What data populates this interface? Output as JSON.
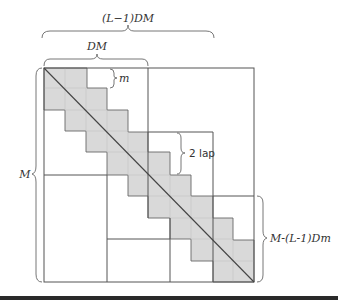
{
  "diagram": {
    "labels": {
      "top_span": "(L−1)DM",
      "dm_span": "DM",
      "m_span": "m",
      "overlap": "2 lap",
      "left_span": "M",
      "right_span": "M-(L-1)Dm"
    },
    "colors": {
      "band_fill": "#d9d9d9",
      "line": "#555555",
      "background": "#ffffff",
      "bottom_bar": "#2a2a2a"
    },
    "outer_square": {
      "x": 44,
      "y": 68,
      "width": 210,
      "height": 214
    },
    "blocks": [
      {
        "name": "block-1",
        "x": 44,
        "y": 68,
        "width": 104,
        "height": 107
      },
      {
        "name": "block-2",
        "x": 107,
        "y": 132,
        "width": 106,
        "height": 107
      },
      {
        "name": "block-3",
        "x": 170,
        "y": 196,
        "width": 84,
        "height": 86
      }
    ],
    "step_count": 10
  }
}
